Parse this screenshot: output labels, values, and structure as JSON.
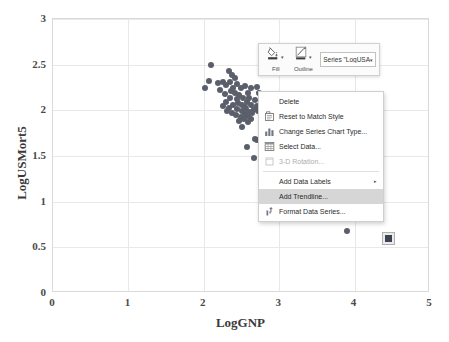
{
  "chart_data": {
    "type": "scatter",
    "title": "",
    "xlabel": "LogGNP",
    "ylabel": "LogUSMort5",
    "xlim": [
      0,
      5
    ],
    "ylim": [
      0,
      3
    ],
    "xticks": [
      "0",
      "1",
      "2",
      "3",
      "4",
      "5"
    ],
    "yticks": [
      "0",
      "0.5",
      "1",
      "1.5",
      "2",
      "2.5",
      "3"
    ],
    "grid": true,
    "legend": "none",
    "series": [
      {
        "name": "LogUSA",
        "marker_color": "#5a5f6b",
        "points": [
          [
            2.1,
            2.5
          ],
          [
            2.33,
            2.43
          ],
          [
            2.37,
            2.39
          ],
          [
            2.35,
            2.31
          ],
          [
            2.01,
            2.25
          ],
          [
            2.07,
            2.32
          ],
          [
            2.19,
            2.3
          ],
          [
            2.26,
            2.31
          ],
          [
            2.3,
            2.28
          ],
          [
            2.41,
            2.35
          ],
          [
            2.44,
            2.29
          ],
          [
            2.49,
            2.24
          ],
          [
            2.55,
            2.27
          ],
          [
            2.62,
            2.24
          ],
          [
            2.7,
            2.26
          ],
          [
            2.41,
            2.19
          ],
          [
            2.47,
            2.17
          ],
          [
            2.52,
            2.14
          ],
          [
            2.58,
            2.19
          ],
          [
            2.35,
            2.14
          ],
          [
            2.3,
            2.09
          ],
          [
            2.26,
            2.05
          ],
          [
            2.33,
            2.03
          ],
          [
            2.39,
            2.06
          ],
          [
            2.45,
            2.08
          ],
          [
            2.51,
            2.06
          ],
          [
            2.57,
            2.09
          ],
          [
            2.63,
            2.06
          ],
          [
            2.68,
            2.11
          ],
          [
            2.73,
            2.19
          ],
          [
            2.44,
            2.01
          ],
          [
            2.5,
            1.99
          ],
          [
            2.56,
            2.01
          ],
          [
            2.61,
            1.98
          ],
          [
            2.66,
            2.02
          ],
          [
            2.37,
            1.97
          ],
          [
            2.31,
            1.99
          ],
          [
            2.43,
            1.95
          ],
          [
            2.49,
            1.93
          ],
          [
            2.54,
            1.96
          ],
          [
            2.59,
            1.94
          ],
          [
            2.64,
            1.97
          ],
          [
            2.47,
            1.88
          ],
          [
            2.53,
            1.9
          ],
          [
            2.58,
            1.87
          ],
          [
            2.5,
            1.82
          ],
          [
            2.68,
            1.69
          ],
          [
            2.71,
            1.67
          ],
          [
            2.57,
            1.6
          ],
          [
            2.66,
            1.48
          ],
          [
            2.22,
            2.22
          ],
          [
            2.28,
            2.18
          ],
          [
            2.39,
            2.25
          ],
          [
            2.6,
            2.13
          ],
          [
            2.44,
            2.12
          ],
          [
            2.54,
            2.04
          ],
          [
            2.36,
            2.21
          ],
          [
            2.63,
            1.9
          ],
          [
            2.7,
            2.05
          ],
          [
            2.72,
            1.99
          ],
          [
            3.9,
            0.68
          ]
        ]
      }
    ],
    "selected_point": {
      "x": 4.45,
      "y": 0.6,
      "series": "LogUSA"
    }
  },
  "mini_toolbar": {
    "fill_label": "Fill",
    "outline_label": "Outline",
    "series_dropdown_value": "Series \"LogUSA",
    "caret_glyph": "▾"
  },
  "context_menu": {
    "items": [
      {
        "id": "delete",
        "label": "Delete",
        "icon": "none",
        "disabled": false,
        "highlighted": false,
        "submenu": false,
        "separator_after": false
      },
      {
        "id": "reset-match-style",
        "label": "Reset to Match Style",
        "icon": "reset-icon",
        "disabled": false,
        "highlighted": false,
        "submenu": false,
        "separator_after": false
      },
      {
        "id": "change-chart-type",
        "label": "Change Series Chart Type...",
        "icon": "bar-chart-icon",
        "disabled": false,
        "highlighted": false,
        "submenu": false,
        "separator_after": false
      },
      {
        "id": "select-data",
        "label": "Select Data...",
        "icon": "table-icon",
        "disabled": false,
        "highlighted": false,
        "submenu": false,
        "separator_after": false
      },
      {
        "id": "3d-rotation",
        "label": "3-D Rotation...",
        "icon": "cube-icon",
        "disabled": true,
        "highlighted": false,
        "submenu": false,
        "separator_after": true
      },
      {
        "id": "add-data-labels",
        "label": "Add Data Labels",
        "icon": "none",
        "disabled": false,
        "highlighted": false,
        "submenu": true,
        "separator_after": false
      },
      {
        "id": "add-trendline",
        "label": "Add Trendline...",
        "icon": "none",
        "disabled": false,
        "highlighted": true,
        "submenu": false,
        "separator_after": false
      },
      {
        "id": "format-data-series",
        "label": "Format Data Series...",
        "icon": "format-icon",
        "disabled": false,
        "highlighted": false,
        "submenu": false,
        "separator_after": false
      }
    ],
    "submenu_arrow_glyph": "▸"
  }
}
